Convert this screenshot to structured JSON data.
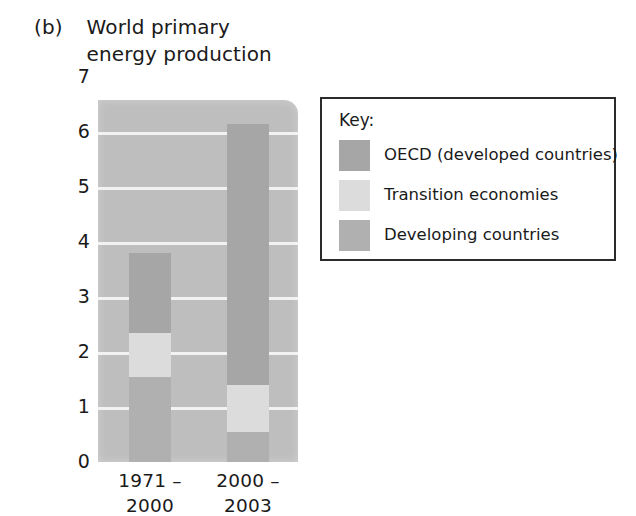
{
  "figure": {
    "panel_letter": "(b)",
    "title": "World primary\nenergy production"
  },
  "legend": {
    "title": "Key:",
    "entries": [
      {
        "label": "OECD (developed countries)",
        "color": "#a6a6a6"
      },
      {
        "label": "Transition economies",
        "color": "#dcdcdc"
      },
      {
        "label": "Developing countries",
        "color": "#b0b0b0"
      }
    ]
  },
  "chart_data": {
    "type": "bar",
    "subtype": "stacked",
    "title": "World primary energy production",
    "xlabel": "",
    "ylabel": "Energy production (billions of tons of oil)",
    "categories": [
      "1971 –\n2000",
      "2000 –\n2003"
    ],
    "category_labels_flat": [
      "1971 – 2000",
      "2000 – 2003"
    ],
    "ylim": [
      0,
      7
    ],
    "yticks": [
      0,
      1,
      2,
      3,
      4,
      5,
      6,
      7
    ],
    "ytick_labels": [
      "0",
      "1",
      "2",
      "3",
      "4",
      "5",
      "6",
      "7"
    ],
    "grid": true,
    "grid_axis": "y",
    "grid_color": "#f2f2f2",
    "plot_background": "#bebebe",
    "legend_position": "right-outside",
    "series": [
      {
        "name": "Developing countries",
        "color": "#b0b0b0",
        "values": [
          1.55,
          0.55
        ]
      },
      {
        "name": "Transition economies",
        "color": "#dcdcdc",
        "values": [
          0.8,
          0.85
        ]
      },
      {
        "name": "OECD (developed countries)",
        "color": "#a6a6a6",
        "values": [
          1.45,
          4.75
        ]
      }
    ],
    "stack_order": "bottom-to-top",
    "totals": [
      3.8,
      6.15
    ]
  },
  "axis": {
    "y_title": "Energy production (billions of tons of oil)",
    "tick_labels": [
      "7",
      "6",
      "5",
      "4",
      "3",
      "2",
      "1",
      "0"
    ]
  }
}
